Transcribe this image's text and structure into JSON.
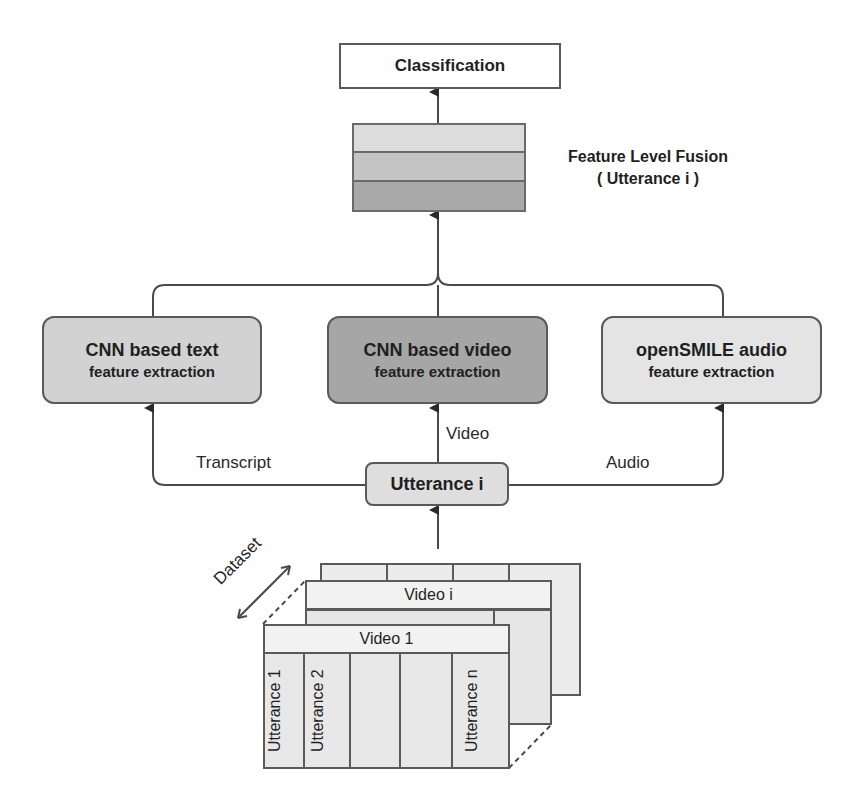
{
  "top": {
    "classification_label": "Classification",
    "fusion_label_line1": "Feature Level Fusion",
    "fusion_label_line2": "( Utterance i )"
  },
  "extractors": [
    {
      "title": "CNN based text",
      "subtitle": "feature extraction",
      "fill": "#d2d2d2"
    },
    {
      "title": "CNN based video",
      "subtitle": "feature extraction",
      "fill": "#a6a6a6"
    },
    {
      "title": "openSMILE audio",
      "subtitle": "feature extraction",
      "fill": "#e4e4e4"
    }
  ],
  "edges": {
    "transcript": "Transcript",
    "video": "Video",
    "audio": "Audio"
  },
  "utterance_node": "Utterance i",
  "dataset": {
    "label": "Dataset",
    "middle_card_title": "Video i",
    "front_card_title": "Video 1",
    "front_columns": [
      "Utterance 1",
      "Utterance 2",
      "",
      "",
      "Utterance n"
    ]
  },
  "fusion_bands": [
    "#dcdcdc",
    "#c4c4c4",
    "#a9a9a9"
  ]
}
